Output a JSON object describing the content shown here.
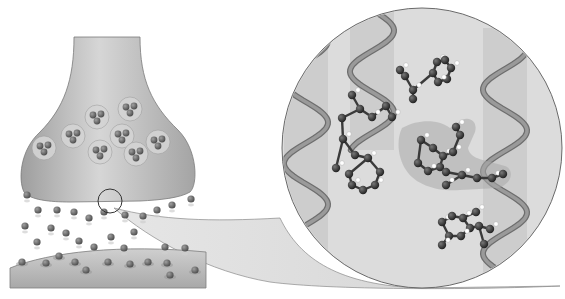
{
  "figure": {
    "width": 565,
    "height": 299,
    "background": "#ffffff",
    "colors": {
      "terminal_fill": "#bdbdbd",
      "terminal_edge": "#7a7a7a",
      "vesicle_fill": "#d2d2d2",
      "molecule": "#6b6b6b",
      "molecule_dark": "#3a3a3a",
      "post_membrane": "#b5b5b5",
      "magnifier_fill": "#dcdcdc",
      "helix": "#8c8c8c",
      "helix_band": "#c6c6c6",
      "ligand_atom": "#2e2e2e",
      "hydrogen": "#ffffff",
      "pocket": "#a9a9a9"
    }
  },
  "synapse": {
    "vesicles": [
      {
        "cx": 97,
        "cy": 117
      },
      {
        "cx": 130,
        "cy": 109
      },
      {
        "cx": 73,
        "cy": 136
      },
      {
        "cx": 122,
        "cy": 136
      },
      {
        "cx": 44,
        "cy": 148
      },
      {
        "cx": 100,
        "cy": 152
      },
      {
        "cx": 136,
        "cy": 154
      },
      {
        "cx": 158,
        "cy": 142
      }
    ],
    "released_molecules": [
      [
        27,
        195
      ],
      [
        38,
        210
      ],
      [
        57,
        210
      ],
      [
        74,
        212
      ],
      [
        89,
        218
      ],
      [
        104,
        212
      ],
      [
        125,
        215
      ],
      [
        143,
        216
      ],
      [
        157,
        210
      ],
      [
        172,
        205
      ],
      [
        191,
        199
      ],
      [
        25,
        226
      ],
      [
        51,
        228
      ],
      [
        66,
        233
      ],
      [
        79,
        241
      ],
      [
        111,
        237
      ],
      [
        134,
        232
      ],
      [
        165,
        247
      ],
      [
        37,
        242
      ],
      [
        94,
        247
      ],
      [
        124,
        248
      ],
      [
        185,
        248
      ]
    ],
    "receptor_molecules": [
      [
        22,
        262
      ],
      [
        46,
        263
      ],
      [
        59,
        256
      ],
      [
        75,
        262
      ],
      [
        108,
        262
      ],
      [
        130,
        264
      ],
      [
        148,
        262
      ],
      [
        167,
        263
      ],
      [
        195,
        270
      ],
      [
        86,
        270
      ],
      [
        170,
        275
      ]
    ],
    "highlight_circle": {
      "cx": 110,
      "cy": 201,
      "r": 12
    }
  },
  "magnifier": {
    "cx": 422,
    "cy": 148,
    "r": 140,
    "helices": [
      {
        "x": 306,
        "top": 20,
        "bottom": 290,
        "amp": 22,
        "period": 82
      },
      {
        "x": 372,
        "top": 10,
        "bottom": 150,
        "amp": 22,
        "period": 82
      },
      {
        "x": 505,
        "top": 28,
        "bottom": 286,
        "amp": 22,
        "period": 82
      }
    ],
    "ligands": [
      {
        "atoms": [
          [
            437,
            62
          ],
          [
            445,
            60
          ],
          [
            451,
            68
          ],
          [
            447,
            79
          ],
          [
            438,
            82
          ],
          [
            433,
            73
          ],
          [
            413,
            90
          ],
          [
            405,
            76
          ],
          [
            400,
            70
          ],
          [
            413,
            99
          ]
        ],
        "bonds": [
          [
            0,
            1
          ],
          [
            1,
            2
          ],
          [
            2,
            3
          ],
          [
            3,
            4
          ],
          [
            4,
            5
          ],
          [
            5,
            0
          ],
          [
            5,
            6
          ],
          [
            6,
            7
          ],
          [
            7,
            8
          ],
          [
            6,
            9
          ]
        ]
      },
      {
        "atoms": [
          [
            352,
            95
          ],
          [
            360,
            109
          ],
          [
            372,
            117
          ],
          [
            386,
            106
          ],
          [
            392,
            117
          ],
          [
            342,
            118
          ],
          [
            343,
            139
          ],
          [
            355,
            155
          ],
          [
            368,
            158
          ],
          [
            380,
            172
          ],
          [
            375,
            185
          ],
          [
            363,
            190
          ],
          [
            352,
            185
          ],
          [
            349,
            174
          ],
          [
            336,
            168
          ]
        ],
        "bonds": [
          [
            0,
            1
          ],
          [
            1,
            2
          ],
          [
            2,
            3
          ],
          [
            3,
            4
          ],
          [
            1,
            5
          ],
          [
            5,
            6
          ],
          [
            6,
            7
          ],
          [
            7,
            8
          ],
          [
            8,
            9
          ],
          [
            9,
            10
          ],
          [
            10,
            11
          ],
          [
            11,
            12
          ],
          [
            12,
            13
          ],
          [
            13,
            8
          ],
          [
            6,
            14
          ]
        ]
      },
      {
        "atoms": [
          [
            421,
            140
          ],
          [
            433,
            148
          ],
          [
            443,
            156
          ],
          [
            440,
            167
          ],
          [
            428,
            171
          ],
          [
            418,
            163
          ],
          [
            453,
            152
          ],
          [
            460,
            135
          ],
          [
            456,
            127
          ],
          [
            446,
            172
          ],
          [
            462,
            175
          ],
          [
            477,
            178
          ],
          [
            492,
            178
          ],
          [
            503,
            174
          ],
          [
            446,
            185
          ]
        ],
        "bonds": [
          [
            0,
            1
          ],
          [
            1,
            2
          ],
          [
            2,
            3
          ],
          [
            3,
            4
          ],
          [
            4,
            5
          ],
          [
            5,
            0
          ],
          [
            2,
            6
          ],
          [
            6,
            7
          ],
          [
            7,
            8
          ],
          [
            3,
            9
          ],
          [
            9,
            10
          ],
          [
            10,
            11
          ],
          [
            11,
            12
          ],
          [
            12,
            13
          ],
          [
            10,
            14
          ]
        ]
      },
      {
        "atoms": [
          [
            442,
            222
          ],
          [
            452,
            216
          ],
          [
            463,
            218
          ],
          [
            470,
            228
          ],
          [
            461,
            236
          ],
          [
            449,
            236
          ],
          [
            476,
            212
          ],
          [
            479,
            226
          ],
          [
            490,
            229
          ],
          [
            484,
            244
          ],
          [
            442,
            245
          ]
        ],
        "bonds": [
          [
            0,
            1
          ],
          [
            1,
            2
          ],
          [
            2,
            3
          ],
          [
            3,
            4
          ],
          [
            4,
            5
          ],
          [
            5,
            0
          ],
          [
            2,
            6
          ],
          [
            3,
            7
          ],
          [
            7,
            8
          ],
          [
            7,
            9
          ],
          [
            5,
            10
          ]
        ]
      }
    ],
    "pocket_path": "M402 128 C420 118 440 120 450 128 L462 120 C470 116 478 122 475 132 L468 148 C470 160 486 160 505 166 C515 170 512 184 498 188 L460 190 C440 192 416 186 406 170 C398 158 396 140 402 128 Z"
  }
}
